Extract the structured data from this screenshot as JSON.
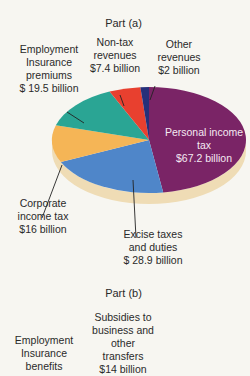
{
  "chart_data": [
    {
      "type": "pie",
      "title": "Part (a)",
      "unit": "$ billion",
      "slices": [
        {
          "label": "Personal income tax",
          "value": 67.2,
          "text": "$67.2 billion",
          "color": "#7a2466"
        },
        {
          "label": "Excise taxes and duties",
          "value": 28.9,
          "text": "$ 28.9 billion",
          "color": "#4f86c9"
        },
        {
          "label": "Corporate income tax",
          "value": 16,
          "text": "$16 billion",
          "color": "#f5b556"
        },
        {
          "label": "Employment Insurance premiums",
          "value": 19.5,
          "text": "$ 19.5 billion",
          "color": "#2aa594"
        },
        {
          "label": "Non-tax revenues",
          "value": 7.4,
          "text": "$7.4 billion",
          "color": "#e8402f"
        },
        {
          "label": "Other revenues",
          "value": 2,
          "text": "$2 billion",
          "color": "#26307a"
        }
      ]
    },
    {
      "type": "pie",
      "title": "Part (b)",
      "unit": "$ billion",
      "slices": [
        {
          "label": "Subsidies to business and other transfers",
          "value": 14,
          "text": "$14 billion"
        },
        {
          "label": "Employment Insurance benefits",
          "value": null,
          "text": ""
        }
      ]
    }
  ],
  "labels": {
    "part_a": "Part (a)",
    "part_b": "Part (b)",
    "ei": [
      "Employment",
      "Insurance",
      "premiums",
      "$ 19.5 billion"
    ],
    "nontax": [
      "Non-tax",
      "revenues",
      "$7.4 billion"
    ],
    "other": [
      "Other",
      "revenues",
      "$2 billion"
    ],
    "personal": [
      "Personal income",
      "tax",
      "$67.2 billion"
    ],
    "corporate": [
      "Corporate",
      "income tax",
      "$16 billion"
    ],
    "excise": [
      "Excise taxes",
      "and duties",
      "$ 28.9 billion"
    ],
    "subsidies": [
      "Subsidies to",
      "business and",
      "other",
      "transfers",
      "$14 billion"
    ],
    "eib": [
      "Employment",
      "Insurance",
      "benefits"
    ]
  },
  "colors": {
    "background": "#f7f6f1",
    "pie_side": "#efdcb5"
  }
}
